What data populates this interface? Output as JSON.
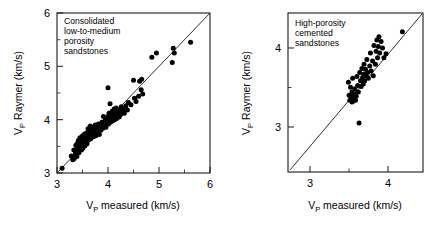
{
  "figure": {
    "background": "#ffffff",
    "marker_color": "#000000",
    "axis_color": "#1a1a1a"
  },
  "chart_data": [
    {
      "type": "scatter",
      "panel": "left",
      "title": "",
      "annotation": [
        "Consolidated",
        "low-to-medium",
        "porosity",
        "sandstones"
      ],
      "annotation_text": "Consolidated low-to-medium porosity sandstones",
      "xlabel": "V",
      "xlabel_sub": "P",
      "xlabel_rest": " measured (km/s)",
      "ylabel": "V",
      "ylabel_sub": "P",
      "ylabel_rest": " Raymer (km/s)",
      "xlim": [
        3,
        6
      ],
      "ylim": [
        3,
        6
      ],
      "xticks": [
        3,
        4,
        5,
        6
      ],
      "yticks": [
        3,
        4,
        5,
        6
      ],
      "xticklabels": [
        "3",
        "4",
        "5",
        "6"
      ],
      "yticklabels": [
        "3",
        "4",
        "5",
        "6"
      ],
      "minor_tick_step": 0.5,
      "grid": false,
      "legend": "none",
      "reference_line": {
        "type": "one-to-one",
        "from": [
          3,
          3
        ],
        "to": [
          6,
          6
        ]
      },
      "marker_size_px": 3.2,
      "n_points": 104,
      "points": [
        [
          3.1,
          3.09
        ],
        [
          3.28,
          3.32
        ],
        [
          3.31,
          3.25
        ],
        [
          3.33,
          3.43
        ],
        [
          3.34,
          3.27
        ],
        [
          3.36,
          3.36
        ],
        [
          3.37,
          3.52
        ],
        [
          3.38,
          3.44
        ],
        [
          3.39,
          3.31
        ],
        [
          3.4,
          3.56
        ],
        [
          3.41,
          3.47
        ],
        [
          3.42,
          3.61
        ],
        [
          3.43,
          3.38
        ],
        [
          3.44,
          3.54
        ],
        [
          3.45,
          3.66
        ],
        [
          3.46,
          3.49
        ],
        [
          3.47,
          3.58
        ],
        [
          3.48,
          3.43
        ],
        [
          3.49,
          3.62
        ],
        [
          3.5,
          3.55
        ],
        [
          3.5,
          3.7
        ],
        [
          3.51,
          3.47
        ],
        [
          3.52,
          3.64
        ],
        [
          3.53,
          3.57
        ],
        [
          3.54,
          3.73
        ],
        [
          3.55,
          3.51
        ],
        [
          3.56,
          3.66
        ],
        [
          3.57,
          3.6
        ],
        [
          3.58,
          3.75
        ],
        [
          3.59,
          3.55
        ],
        [
          3.6,
          3.68
        ],
        [
          3.61,
          3.83
        ],
        [
          3.62,
          3.62
        ],
        [
          3.63,
          3.77
        ],
        [
          3.64,
          3.7
        ],
        [
          3.65,
          3.88
        ],
        [
          3.66,
          3.64
        ],
        [
          3.67,
          3.79
        ],
        [
          3.68,
          3.72
        ],
        [
          3.7,
          3.86
        ],
        [
          3.71,
          3.68
        ],
        [
          3.72,
          3.8
        ],
        [
          3.74,
          3.74
        ],
        [
          3.75,
          3.9
        ],
        [
          3.76,
          3.7
        ],
        [
          3.78,
          3.84
        ],
        [
          3.8,
          3.76
        ],
        [
          3.81,
          3.92
        ],
        [
          3.83,
          3.72
        ],
        [
          3.85,
          3.88
        ],
        [
          3.86,
          3.8
        ],
        [
          3.88,
          3.95
        ],
        [
          3.9,
          3.84
        ],
        [
          3.91,
          4.06
        ],
        [
          3.93,
          3.9
        ],
        [
          3.95,
          4.0
        ],
        [
          3.96,
          3.86
        ],
        [
          3.98,
          3.96
        ],
        [
          4.0,
          4.6
        ],
        [
          4.0,
          4.06
        ],
        [
          4.01,
          3.92
        ],
        [
          4.02,
          4.12
        ],
        [
          4.03,
          4.0
        ],
        [
          4.04,
          4.3
        ],
        [
          4.05,
          3.95
        ],
        [
          4.06,
          4.08
        ],
        [
          4.07,
          4.02
        ],
        [
          4.08,
          4.16
        ],
        [
          4.09,
          3.98
        ],
        [
          4.1,
          4.1
        ],
        [
          4.11,
          4.04
        ],
        [
          4.12,
          4.2
        ],
        [
          4.13,
          4.0
        ],
        [
          4.14,
          4.12
        ],
        [
          4.15,
          4.06
        ],
        [
          4.16,
          4.22
        ],
        [
          4.17,
          4.02
        ],
        [
          4.18,
          4.14
        ],
        [
          4.19,
          4.08
        ],
        [
          4.2,
          4.18
        ],
        [
          4.22,
          4.05
        ],
        [
          4.23,
          4.16
        ],
        [
          4.25,
          4.1
        ],
        [
          4.26,
          4.24
        ],
        [
          4.28,
          4.14
        ],
        [
          4.3,
          4.2
        ],
        [
          4.32,
          4.12
        ],
        [
          4.35,
          4.26
        ],
        [
          4.38,
          4.18
        ],
        [
          4.4,
          4.32
        ],
        [
          4.45,
          4.28
        ],
        [
          4.5,
          4.74
        ],
        [
          4.52,
          4.4
        ],
        [
          4.55,
          4.34
        ],
        [
          4.6,
          4.44
        ],
        [
          4.62,
          4.72
        ],
        [
          4.65,
          4.56
        ],
        [
          4.66,
          4.76
        ],
        [
          4.68,
          4.48
        ],
        [
          4.86,
          5.17
        ],
        [
          4.95,
          5.25
        ],
        [
          5.26,
          5.07
        ],
        [
          5.28,
          5.34
        ],
        [
          5.3,
          5.25
        ],
        [
          5.62,
          5.45
        ]
      ]
    },
    {
      "type": "scatter",
      "panel": "right",
      "title": "",
      "annotation": [
        "High-porosity",
        "cemented",
        "sandstones"
      ],
      "annotation_text": "High-porosity cemented sandstones",
      "xlabel": "V",
      "xlabel_sub": "P",
      "xlabel_rest": " measured (km/s)",
      "ylabel": "V",
      "ylabel_sub": "P",
      "ylabel_rest": " Raymer (km/s)",
      "xlim": [
        2.55,
        4.45
      ],
      "ylim": [
        2.4,
        4.35
      ],
      "xticks": [
        3,
        4
      ],
      "yticks": [
        3,
        4
      ],
      "xticklabels": [
        "3",
        "4"
      ],
      "yticklabels": [
        "3",
        "4"
      ],
      "minor_tick_step": 0.5,
      "grid": false,
      "legend": "none",
      "reference_line": {
        "type": "one-to-one",
        "from": [
          2.55,
          2.55
        ],
        "to": [
          4.35,
          4.35
        ]
      },
      "marker_size_px": 3.2,
      "n_points": 52,
      "points": [
        [
          3.4,
          3.5
        ],
        [
          3.41,
          3.34
        ],
        [
          3.42,
          3.28
        ],
        [
          3.43,
          3.44
        ],
        [
          3.44,
          3.31
        ],
        [
          3.45,
          3.26
        ],
        [
          3.45,
          3.38
        ],
        [
          3.46,
          3.3
        ],
        [
          3.46,
          3.55
        ],
        [
          3.47,
          3.27
        ],
        [
          3.47,
          3.34
        ],
        [
          3.48,
          3.31
        ],
        [
          3.49,
          3.42
        ],
        [
          3.5,
          3.28
        ],
        [
          3.5,
          3.36
        ],
        [
          3.51,
          3.33
        ],
        [
          3.52,
          3.57
        ],
        [
          3.53,
          3.46
        ],
        [
          3.54,
          3.38
        ],
        [
          3.55,
          3.0
        ],
        [
          3.56,
          3.62
        ],
        [
          3.57,
          3.52
        ],
        [
          3.58,
          3.45
        ],
        [
          3.59,
          3.67
        ],
        [
          3.6,
          3.56
        ],
        [
          3.61,
          3.48
        ],
        [
          3.62,
          3.72
        ],
        [
          3.62,
          3.6
        ],
        [
          3.63,
          3.52
        ],
        [
          3.64,
          3.66
        ],
        [
          3.65,
          3.58
        ],
        [
          3.66,
          3.78
        ],
        [
          3.67,
          3.62
        ],
        [
          3.68,
          3.55
        ],
        [
          3.7,
          3.7
        ],
        [
          3.71,
          3.86
        ],
        [
          3.72,
          3.64
        ],
        [
          3.74,
          3.76
        ],
        [
          3.75,
          3.58
        ],
        [
          3.76,
          3.95
        ],
        [
          3.78,
          3.72
        ],
        [
          3.79,
          3.88
        ],
        [
          3.8,
          4.02
        ],
        [
          3.81,
          3.8
        ],
        [
          3.82,
          3.94
        ],
        [
          3.83,
          4.06
        ],
        [
          3.84,
          3.86
        ],
        [
          3.86,
          4.0
        ],
        [
          3.88,
          3.92
        ],
        [
          3.9,
          3.8
        ],
        [
          3.93,
          3.85
        ],
        [
          4.16,
          4.12
        ]
      ]
    }
  ]
}
